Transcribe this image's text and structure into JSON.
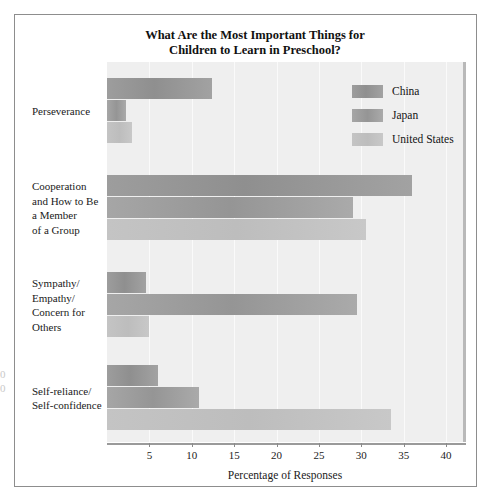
{
  "chart_data": {
    "type": "bar",
    "orientation": "horizontal",
    "title": "What Are the Most Important Things for Children to Learn in Preschool?",
    "title_lines": [
      "What Are the Most Important Things for",
      "Children to Learn in Preschool?"
    ],
    "xlabel": "Percentage of Responses",
    "ylabel": "",
    "xlim": [
      0,
      42
    ],
    "xticks": [
      5,
      10,
      15,
      20,
      25,
      30,
      35,
      40
    ],
    "xtick_labels": [
      "5",
      "10",
      "15",
      "20",
      "25",
      "30",
      "35",
      "40"
    ],
    "grid": true,
    "legend_position": "top-right",
    "categories": [
      "Perseverance",
      "Cooperation and How to Be a Member of a Group",
      "Sympathy/ Empathy/ Concern for Others",
      "Self-reliance/ Self-confidence"
    ],
    "category_label_lines": [
      [
        "Perseverance"
      ],
      [
        "Cooperation",
        "and How to Be",
        "a Member",
        "of a Group"
      ],
      [
        "Sympathy/",
        "Empathy/",
        "Concern for",
        "Others"
      ],
      [
        "Self-reliance/",
        "Self-confidence"
      ]
    ],
    "series": [
      {
        "name": "China",
        "color": "#989898",
        "values": [
          12.4,
          36.0,
          4.6,
          6.0
        ]
      },
      {
        "name": "Japan",
        "color": "#9e9e9e",
        "values": [
          2.3,
          29.0,
          29.5,
          10.8
        ]
      },
      {
        "name": "United States",
        "color": "#c2c2c2",
        "values": [
          3.0,
          30.5,
          5.0,
          33.5
        ]
      }
    ]
  },
  "legend": {
    "items": [
      {
        "label": "China",
        "swatch": "china-swatch"
      },
      {
        "label": "Japan",
        "swatch": "japan-swatch"
      },
      {
        "label": "United States",
        "swatch": "us-swatch"
      }
    ]
  },
  "margin_marks": {
    "top": "0",
    "bottom": "0"
  }
}
